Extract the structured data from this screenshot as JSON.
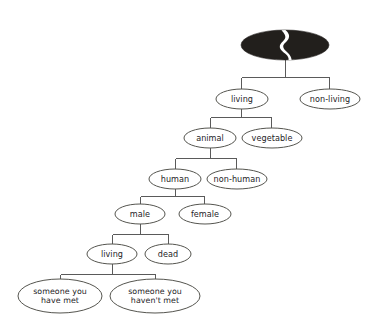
{
  "diagram": {
    "type": "tree",
    "background_color": "#ffffff",
    "edge_color": "#5a5a5a",
    "node_stroke_color": "#55554f",
    "node_fill_color": "#ffffff",
    "root_fill_color": "#221f1c",
    "root": {
      "name": "root-node",
      "label": "",
      "style": "filled-black-ellipse-with-white-split",
      "cx": 285,
      "cy": 45,
      "rx": 44,
      "ry": 15
    },
    "nodes": [
      {
        "id": "living",
        "label": "living",
        "cx": 242,
        "cy": 99,
        "rx": 26,
        "ry": 10,
        "lines": [
          "living"
        ]
      },
      {
        "id": "non-living",
        "label": "non-living",
        "cx": 330,
        "cy": 99,
        "rx": 30,
        "ry": 10,
        "lines": [
          "non-living"
        ]
      },
      {
        "id": "animal",
        "label": "animal",
        "cx": 210,
        "cy": 138,
        "rx": 26,
        "ry": 10,
        "lines": [
          "animal"
        ]
      },
      {
        "id": "vegetable",
        "label": "vegetable",
        "cx": 272,
        "cy": 138,
        "rx": 30,
        "ry": 10,
        "lines": [
          "vegetable"
        ]
      },
      {
        "id": "human",
        "label": "human",
        "cx": 175,
        "cy": 179,
        "rx": 26,
        "ry": 10,
        "lines": [
          "human"
        ]
      },
      {
        "id": "non-human",
        "label": "non-human",
        "cx": 237,
        "cy": 179,
        "rx": 30,
        "ry": 10,
        "lines": [
          "non-human"
        ]
      },
      {
        "id": "male",
        "label": "male",
        "cx": 140,
        "cy": 214,
        "rx": 25,
        "ry": 10,
        "lines": [
          "male"
        ]
      },
      {
        "id": "female",
        "label": "female",
        "cx": 205,
        "cy": 214,
        "rx": 26,
        "ry": 10,
        "lines": [
          "female"
        ]
      },
      {
        "id": "living-2",
        "label": "living",
        "cx": 112,
        "cy": 254,
        "rx": 25,
        "ry": 10,
        "lines": [
          "living"
        ]
      },
      {
        "id": "dead",
        "label": "dead",
        "cx": 168,
        "cy": 254,
        "rx": 23,
        "ry": 10,
        "lines": [
          "dead"
        ]
      },
      {
        "id": "someone-have-met",
        "label": "someone you have met",
        "cx": 60,
        "cy": 296,
        "rx": 42,
        "ry": 17,
        "lines": [
          "someone you",
          "have met"
        ]
      },
      {
        "id": "someone-havent-met",
        "label": "someone you haven't met",
        "cx": 155,
        "cy": 296,
        "rx": 45,
        "ry": 17,
        "lines": [
          "someone you",
          "haven't met"
        ]
      }
    ],
    "edges": [
      {
        "from": "root",
        "to": "living",
        "type": "elbow"
      },
      {
        "from": "root",
        "to": "non-living",
        "type": "elbow"
      },
      {
        "from": "living",
        "to": "animal",
        "type": "elbow"
      },
      {
        "from": "living",
        "to": "vegetable",
        "type": "elbow"
      },
      {
        "from": "animal",
        "to": "human",
        "type": "elbow"
      },
      {
        "from": "animal",
        "to": "non-human",
        "type": "elbow"
      },
      {
        "from": "human",
        "to": "male",
        "type": "elbow"
      },
      {
        "from": "human",
        "to": "female",
        "type": "elbow"
      },
      {
        "from": "male",
        "to": "living-2",
        "type": "elbow"
      },
      {
        "from": "male",
        "to": "dead",
        "type": "elbow"
      },
      {
        "from": "living-2",
        "to": "someone-have-met",
        "type": "elbow"
      },
      {
        "from": "living-2",
        "to": "someone-havent-met",
        "type": "elbow"
      }
    ]
  }
}
